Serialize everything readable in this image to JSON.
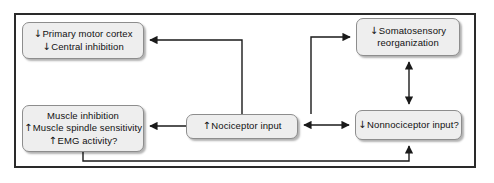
{
  "diagram": {
    "title": "",
    "frame": {
      "border_color": "#2a2a2a"
    },
    "node_style": {
      "fill": "#eeeeee",
      "stroke": "#8d8d8d",
      "text_color": "#111111"
    },
    "nodes": [
      {
        "id": "primary-motor-cortex",
        "name": "node-primary-motor-cortex",
        "lines": [
          {
            "arrow": "↓",
            "text": "Primary motor cortex"
          },
          {
            "arrow": "↓",
            "text": "Central inhibition"
          }
        ]
      },
      {
        "id": "somatosensory-reorganization",
        "name": "node-somatosensory-reorganization",
        "lines": [
          {
            "arrow": "↓",
            "text": "Somatosensory"
          },
          {
            "arrow": "",
            "text": "reorganization"
          }
        ]
      },
      {
        "id": "muscle-inhibition",
        "name": "node-muscle-inhibition",
        "lines": [
          {
            "arrow": "",
            "text": "Muscle inhibition"
          },
          {
            "arrow": "↑",
            "text": "Muscle spindle sensitivity"
          },
          {
            "arrow": "↑",
            "text": "EMG activity?"
          }
        ]
      },
      {
        "id": "nociceptor-input",
        "name": "node-nociceptor-input",
        "lines": [
          {
            "arrow": "↑",
            "text": "Nociceptor input"
          }
        ]
      },
      {
        "id": "nonnociceptor-input",
        "name": "node-nonnociceptor-input",
        "lines": [
          {
            "arrow": "↓",
            "text": "Nonnociceptor input?"
          }
        ]
      }
    ],
    "connectors": [
      {
        "id": "noci-to-motor",
        "from": "nociceptor-input",
        "to": "primary-motor-cortex",
        "direction": "one-way"
      },
      {
        "id": "noci-to-somato",
        "from": "nociceptor-input",
        "to": "somatosensory-reorganization",
        "direction": "one-way"
      },
      {
        "id": "noci-to-muscle",
        "from": "nociceptor-input",
        "to": "muscle-inhibition",
        "direction": "one-way"
      },
      {
        "id": "noci-nonnoci",
        "from": "nociceptor-input",
        "to": "nonnociceptor-input",
        "direction": "bidirectional"
      },
      {
        "id": "somato-nonnoci",
        "from": "somatosensory-reorganization",
        "to": "nonnociceptor-input",
        "direction": "bidirectional"
      },
      {
        "id": "muscle-to-nonnoci",
        "from": "muscle-inhibition",
        "to": "nonnociceptor-input",
        "direction": "one-way"
      }
    ]
  }
}
